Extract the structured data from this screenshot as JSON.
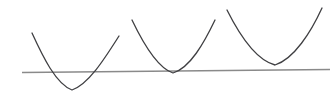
{
  "figure": {
    "width": 335,
    "height": 98,
    "background_color": "#ffffff",
    "curve_color": "#3f3f42",
    "line_color": "#8a8a8a",
    "curve_stroke_width": 1.3,
    "line_stroke_width": 1.6
  },
  "chart_data": {
    "type": "line",
    "xlabel": "",
    "ylabel": "",
    "xlim": [
      0,
      335
    ],
    "ylim": [
      98,
      0
    ],
    "grid": false,
    "legend": "none",
    "annotations": [
      "Parabola 1 vertex lies below the line (two intersections)",
      "Parabola 2 vertex touches the line (one intersection, tangent)",
      "Parabola 3 vertex lies above the line (no intersection)"
    ],
    "series": [
      {
        "name": "straight-line",
        "type": "line",
        "shape": "straight",
        "points": [
          {
            "x": 22,
            "y": 72.5
          },
          {
            "x": 330,
            "y": 69.5
          }
        ],
        "path": "M 22 72.5 L 330 69.5",
        "color": "#8a8a8a"
      },
      {
        "name": "parabola-1",
        "type": "parabola",
        "opens": "up",
        "vertex": {
          "x": 72,
          "y": 90
        },
        "left_end": {
          "x": 32,
          "y": 33
        },
        "right_end": {
          "x": 119,
          "y": 36
        },
        "relation_to_line": "crosses",
        "intersections": 2,
        "path": "M 32 33 C 43 57, 56 84, 72 90 C 89 84, 105 58, 119 36",
        "color": "#3f3f42"
      },
      {
        "name": "parabola-2",
        "type": "parabola",
        "opens": "up",
        "vertex": {
          "x": 173,
          "y": 73
        },
        "left_end": {
          "x": 132,
          "y": 20
        },
        "right_end": {
          "x": 215,
          "y": 20
        },
        "relation_to_line": "tangent",
        "intersections": 1,
        "path": "M 132 20 C 143 43, 157 68, 173 73 C 190 68, 204 43, 215 20",
        "color": "#3f3f42"
      },
      {
        "name": "parabola-3",
        "type": "parabola",
        "opens": "up",
        "vertex": {
          "x": 275,
          "y": 65
        },
        "left_end": {
          "x": 227,
          "y": 10
        },
        "right_end": {
          "x": 322,
          "y": 8
        },
        "relation_to_line": "above",
        "intersections": 0,
        "path": "M 227 10 C 239 34, 256 60, 275 65 C 294 59, 311 32, 322 8",
        "color": "#3f3f42"
      }
    ]
  }
}
